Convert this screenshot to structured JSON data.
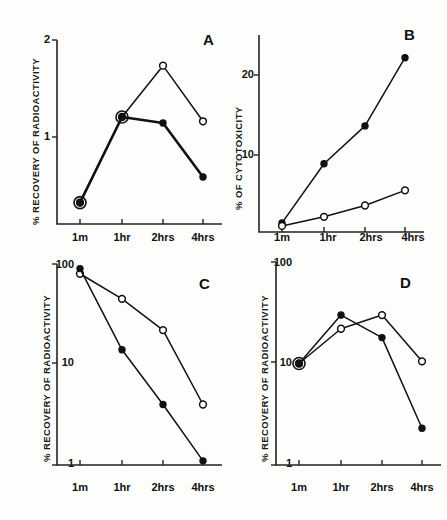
{
  "figure": {
    "panels": [
      "A",
      "B",
      "C",
      "D"
    ],
    "x_categories": [
      "1m",
      "1hr",
      "2hrs",
      "4hrs"
    ]
  },
  "chart_data": [
    {
      "type": "line",
      "panel": "A",
      "title": "A",
      "xlabel": "",
      "ylabel": "% RECOVERY OF RADIOACTIVITY",
      "yscale": "linear",
      "ylim": [
        0,
        2.15
      ],
      "yticks": [
        1,
        2
      ],
      "ytick_labels": [
        "1",
        "2"
      ],
      "categories": [
        "1m",
        "1hr",
        "2hrs",
        "4hrs"
      ],
      "grid": false,
      "legend": "none",
      "series": [
        {
          "name": "open-circle",
          "marker": "open",
          "values": [
            0.25,
            1.25,
            1.85,
            1.2
          ]
        },
        {
          "name": "filled-circle",
          "marker": "filled",
          "values": [
            0.25,
            1.25,
            1.18,
            0.55
          ]
        }
      ]
    },
    {
      "type": "line",
      "panel": "B",
      "title": "B",
      "xlabel": "",
      "ylabel": "% OF CYTOTOXICITY",
      "yscale": "linear",
      "ylim": [
        0,
        26
      ],
      "yticks": [
        10,
        20
      ],
      "ytick_labels": [
        "10",
        "20"
      ],
      "categories": [
        "1m",
        "1hr",
        "2hrs",
        "4hrs"
      ],
      "grid": false,
      "legend": "none",
      "series": [
        {
          "name": "filled-circle",
          "marker": "filled",
          "values": [
            1.2,
            9.0,
            14.0,
            23.0
          ]
        },
        {
          "name": "open-circle",
          "marker": "open",
          "values": [
            0.8,
            2.0,
            3.5,
            5.5
          ]
        }
      ]
    },
    {
      "type": "line",
      "panel": "C",
      "title": "C",
      "xlabel": "",
      "ylabel": "% RECOVERY OF RADIOACTIVITY",
      "yscale": "log",
      "ylim": [
        1,
        100
      ],
      "yticks": [
        1,
        10,
        100
      ],
      "ytick_labels": [
        "1",
        "10",
        "100"
      ],
      "categories": [
        "1m",
        "1hr",
        "2hrs",
        "4hrs"
      ],
      "grid": false,
      "legend": "none",
      "series": [
        {
          "name": "open-circle",
          "marker": "open",
          "values": [
            80,
            45,
            22,
            4.0
          ]
        },
        {
          "name": "filled-circle",
          "marker": "filled",
          "values": [
            90,
            14,
            4.0,
            1.1
          ]
        }
      ]
    },
    {
      "type": "line",
      "panel": "D",
      "title": "D",
      "xlabel": "",
      "ylabel": "% RECOVERY OF RADIOACTIVITY",
      "yscale": "log",
      "ylim": [
        1,
        100
      ],
      "yticks": [
        1,
        10,
        100
      ],
      "ytick_labels": [
        "1",
        "10",
        "100"
      ],
      "categories": [
        "1m",
        "1hr",
        "2hrs",
        "4hrs"
      ],
      "grid": false,
      "legend": "none",
      "series": [
        {
          "name": "filled-circle",
          "marker": "filled",
          "values": [
            10,
            30,
            18,
            2.3
          ]
        },
        {
          "name": "open-circle",
          "marker": "open",
          "values": [
            10,
            22,
            30,
            10.5
          ]
        }
      ]
    }
  ],
  "colors": {
    "ink": "#111111",
    "background": "#fdfdfc"
  }
}
